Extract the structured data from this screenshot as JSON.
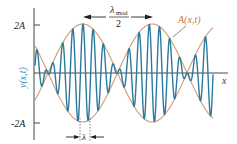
{
  "figure": {
    "type": "wave-packet-diagram",
    "y_axis_label": "y(x,t)",
    "x_axis_label": "x",
    "ticks": [
      {
        "label": "2A",
        "value": 2
      },
      {
        "label": "-2A",
        "value": -2
      }
    ],
    "envelope_label": "A(x,t)",
    "modulation_label": {
      "numerator": "λ",
      "subscript": "mod",
      "denominator": "2"
    },
    "carrier_label": "λ",
    "colors": {
      "wave": "#2a7a9e",
      "envelope": "#d9a07a",
      "axis": "#333333",
      "text": "#222222",
      "y_label": "#3a8fb7",
      "envelope_label": "#c07a4a"
    }
  },
  "chart_data": {
    "type": "line",
    "title": "",
    "xlabel": "x",
    "ylabel": "y(x,t)",
    "yticks": [
      "2A",
      "-2A"
    ],
    "ylim": [
      -2.2,
      2.2
    ],
    "series": [
      {
        "name": "y(x,t) carrier wave",
        "description": "high-frequency oscillation modulated by envelope, about 7 carrier cycles per half modulation period"
      },
      {
        "name": "A(x,t) envelope",
        "description": "±2A|cos(πx/λ_mod)|, nodes where wave amplitude vanishes"
      }
    ],
    "annotations": [
      {
        "text": "λ_mod / 2",
        "meaning": "distance between adjacent envelope maxima"
      },
      {
        "text": "λ",
        "meaning": "carrier wavelength"
      },
      {
        "text": "A(x,t)",
        "meaning": "envelope curve"
      }
    ]
  }
}
